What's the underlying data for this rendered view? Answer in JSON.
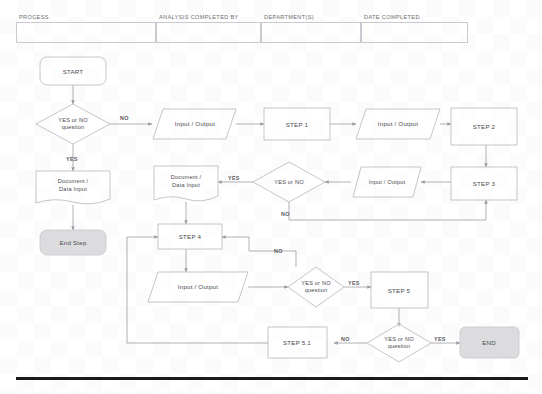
{
  "document": {
    "type": "flowchart-form",
    "header": {
      "columns": [
        {
          "label": "PROCESS",
          "value": ""
        },
        {
          "label": "ANALYSIS COMPLETED BY",
          "value": ""
        },
        {
          "label": "DEPARTMENT(S)",
          "value": ""
        },
        {
          "label": "DATE COMPLETED",
          "value": ""
        }
      ]
    },
    "colors": {
      "terminator_fill": "#dcdcdf",
      "shape_stroke": "#b7b7be",
      "connector": "#9a9aa2",
      "text": "#4a4a50",
      "rule": "#1a1a1a"
    }
  },
  "flowchart": {
    "nodes": [
      {
        "id": "start",
        "shape": "terminator-rounded",
        "label": "START"
      },
      {
        "id": "q1",
        "shape": "decision",
        "label_line1": "YES or NO",
        "label_line2": "question"
      },
      {
        "id": "doc1",
        "shape": "document",
        "label_line1": "Document /",
        "label_line2": "Data Input"
      },
      {
        "id": "endstep",
        "shape": "terminator-filled",
        "label": "End Step"
      },
      {
        "id": "io1",
        "shape": "parallelogram",
        "label": "Input / Output"
      },
      {
        "id": "step1",
        "shape": "process",
        "label": "STEP 1"
      },
      {
        "id": "io2",
        "shape": "parallelogram",
        "label": "Input / Output"
      },
      {
        "id": "step2",
        "shape": "process",
        "label": "STEP 2"
      },
      {
        "id": "doc2",
        "shape": "document",
        "label_line1": "Document /",
        "label_line2": "Data Input"
      },
      {
        "id": "q2",
        "shape": "decision",
        "label_line1": "YES or NO",
        "label_line2": ""
      },
      {
        "id": "io3",
        "shape": "parallelogram",
        "label": "Input / Output"
      },
      {
        "id": "step3",
        "shape": "process",
        "label": "STEP 3"
      },
      {
        "id": "step4",
        "shape": "process",
        "label": "STEP 4"
      },
      {
        "id": "io4",
        "shape": "parallelogram",
        "label": "Input / Output"
      },
      {
        "id": "q3",
        "shape": "decision",
        "label_line1": "YES or NO",
        "label_line2": "question"
      },
      {
        "id": "step5",
        "shape": "process",
        "label": "STEP 5"
      },
      {
        "id": "step51",
        "shape": "process",
        "label": "STEP 5.1"
      },
      {
        "id": "q4",
        "shape": "decision",
        "label_line1": "YES or NO",
        "label_line2": "question"
      },
      {
        "id": "end",
        "shape": "terminator-filled",
        "label": "END"
      }
    ],
    "edge_labels": {
      "q1_no": "NO",
      "q1_yes": "YES",
      "q2_yes": "YES",
      "q2_no": "NO",
      "q3_no": "NO",
      "q3_yes": "YES",
      "q4_no": "NO",
      "q4_yes": "YES"
    }
  }
}
